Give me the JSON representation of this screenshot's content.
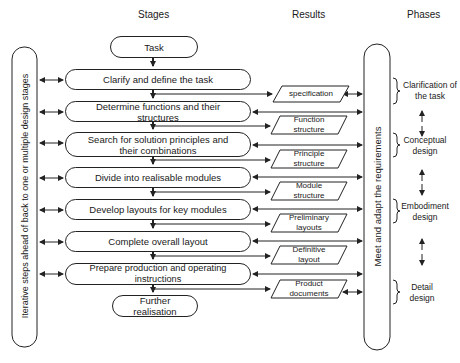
{
  "headers": {
    "stages": "Stages",
    "results": "Results",
    "phases": "Phases"
  },
  "left_bar": {
    "label": "Iterative steps ahead of back to one or multiple design stages"
  },
  "right_bar": {
    "label": "Meet and adapt the requirements"
  },
  "stages": {
    "task": "Task",
    "items": [
      "Clarify and define the task",
      "Determine functions and their structures",
      "Search for solution principles and their combinations",
      "Divide into realisable modules",
      "Develop layouts for key modules",
      "Complete overall layout",
      "Prepare production and operating instructions"
    ],
    "end": "Further realisation"
  },
  "results": [
    "specification",
    "Function structure",
    "Principle structure",
    "Module structure",
    "Preliminary layouts",
    "Definitive layout",
    "Product documents"
  ],
  "phases": [
    "Clarification of the task",
    "Conceptual design",
    "Embodiment design",
    "Detail design"
  ],
  "colors": {
    "line": "#222222",
    "background": "#ffffff"
  }
}
